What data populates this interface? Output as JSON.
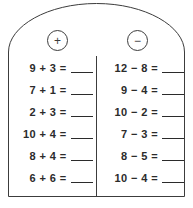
{
  "worksheet": {
    "title": "Addition and Subtraction Practice Tablet",
    "shape": "arched-tablet",
    "border_color": "#3c3c3c",
    "text_color": "#2b2b2b",
    "background_color": "#ffffff"
  },
  "columns": [
    {
      "id": "addition",
      "badge_symbol": "+",
      "badge_name": "plus-icon",
      "problems": [
        {
          "expression": "9 + 3 =",
          "answer": ""
        },
        {
          "expression": "7 + 1 =",
          "answer": ""
        },
        {
          "expression": "2 + 3 =",
          "answer": ""
        },
        {
          "expression": "10 + 4 =",
          "answer": ""
        },
        {
          "expression": "8 + 4 =",
          "answer": ""
        },
        {
          "expression": "6 + 6 =",
          "answer": ""
        }
      ]
    },
    {
      "id": "subtraction",
      "badge_symbol": "−",
      "badge_name": "minus-icon",
      "problems": [
        {
          "expression": "12 − 8 =",
          "answer": ""
        },
        {
          "expression": "9 − 4 =",
          "answer": ""
        },
        {
          "expression": "10 − 2 =",
          "answer": ""
        },
        {
          "expression": "7 − 3 =",
          "answer": ""
        },
        {
          "expression": "8 − 5 =",
          "answer": ""
        },
        {
          "expression": "10 − 4 =",
          "answer": ""
        }
      ]
    }
  ]
}
